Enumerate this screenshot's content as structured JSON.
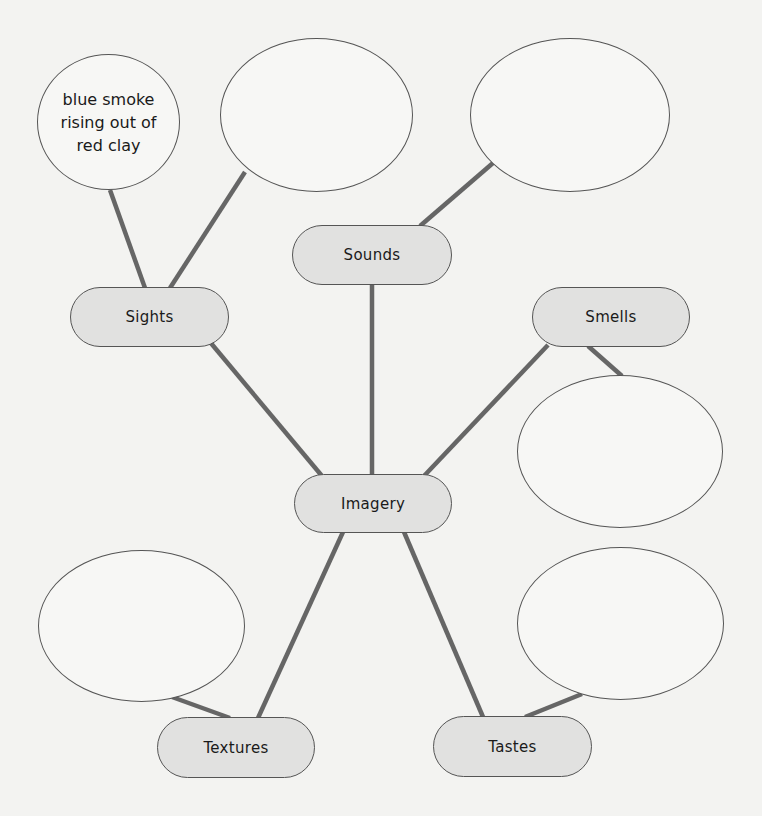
{
  "diagram": {
    "center": {
      "label": "Imagery"
    },
    "categories": [
      {
        "id": "sights",
        "label": "Sights"
      },
      {
        "id": "sounds",
        "label": "Sounds"
      },
      {
        "id": "smells",
        "label": "Smells"
      },
      {
        "id": "textures",
        "label": "Textures"
      },
      {
        "id": "tastes",
        "label": "Tastes"
      }
    ],
    "detail_bubbles": [
      {
        "category": "sights",
        "text": "blue smoke rising out of red clay"
      },
      {
        "category": "sights",
        "text": ""
      },
      {
        "category": "sounds",
        "text": ""
      },
      {
        "category": "smells",
        "text": ""
      },
      {
        "category": "textures",
        "text": ""
      },
      {
        "category": "tastes",
        "text": ""
      }
    ],
    "colors": {
      "background": "#f3f3f1",
      "pill_fill": "#e1e1e0",
      "outline": "#555555",
      "connector": "#666666"
    }
  }
}
